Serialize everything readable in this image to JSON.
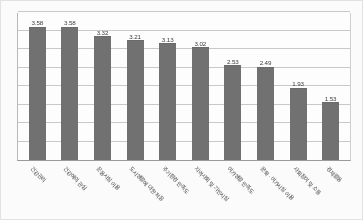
{
  "chart_data": {
    "type": "bar",
    "title": "",
    "xlabel": "",
    "ylabel": "",
    "ylim": [
      0,
      4
    ],
    "grid": true,
    "legend": "none",
    "orientation": "vertical",
    "bar_color": "#717171",
    "gridline_color": "#c9c9c9",
    "label_rotation": 45,
    "categories": [
      "건강관리",
      "건강에의 관심",
      "운동시설 이용",
      "도시생활에 대한 적응",
      "주거환경 만족도",
      "지역사회 및 기반시설",
      "여가생활 만족도",
      "문화 · 여가시설 이용",
      "사회참여 및 소통",
      "경제활동"
    ],
    "values": [
      3.58,
      3.58,
      3.32,
      3.21,
      3.13,
      3.02,
      2.53,
      2.49,
      1.93,
      1.53
    ],
    "value_labels": [
      "3.58",
      "3.58",
      "3.32",
      "3.21",
      "3.13",
      "3.02",
      "2.53",
      "2.49",
      "1.93",
      "1.53"
    ],
    "yticks": [
      0,
      0.5,
      1.0,
      1.5,
      2.0,
      2.5,
      3.0,
      3.5,
      4.0
    ],
    "ytick_labels": [
      "",
      "",
      "",
      "",
      "",
      "",
      "",
      "",
      ""
    ]
  }
}
